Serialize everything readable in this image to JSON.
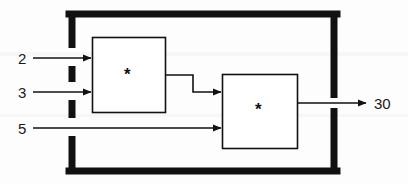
{
  "diagram": {
    "background_color": "#fdfdfd",
    "line_color": "#111111",
    "text_color": "#1a1a1a",
    "outer_boundary": {
      "name": "system-boundary",
      "style": "thick-dashed-left-right",
      "stroke_width": 7
    },
    "inputs": [
      {
        "label": "2",
        "target": "multiplier-1"
      },
      {
        "label": "3",
        "target": "multiplier-1"
      },
      {
        "label": "5",
        "target": "multiplier-2"
      }
    ],
    "blocks": [
      {
        "id": "multiplier-1",
        "symbol": "*",
        "op": "multiply"
      },
      {
        "id": "multiplier-2",
        "symbol": "*",
        "op": "multiply"
      }
    ],
    "internal_edges": [
      {
        "from": "multiplier-1",
        "to": "multiplier-2",
        "style": "stepped"
      }
    ],
    "outputs": [
      {
        "label": "30",
        "source": "multiplier-2"
      }
    ]
  }
}
